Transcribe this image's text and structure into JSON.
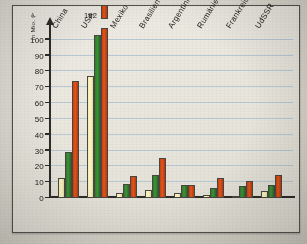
{
  "figure": {
    "corner_mark": "A."
  },
  "chart_data": {
    "type": "bar",
    "title": "",
    "subtitle": "",
    "xlabel": "",
    "ylabel": "in Mio. t",
    "ylim": [
      0,
      110
    ],
    "yticks": [
      0,
      10,
      20,
      30,
      40,
      50,
      60,
      70,
      80,
      90,
      100
    ],
    "ytick_labels": [
      "0",
      "10",
      "20",
      "30",
      "40",
      "50",
      "60",
      "70",
      "80",
      "90",
      "100"
    ],
    "grid": true,
    "legend": "none",
    "categories": [
      "China",
      "USA",
      "Mexiko",
      "Brasilien",
      "Argentinien",
      "Rumänien",
      "Frankreich",
      "UdSSR"
    ],
    "series": [
      {
        "name": "series-1",
        "color": "#f7f1bd",
        "values": [
          12.5,
          77,
          3,
          5,
          3,
          2,
          1.5,
          4.5
        ]
      },
      {
        "name": "series-2",
        "color": "#2f7a2c",
        "values": [
          29,
          103,
          9,
          14.5,
          8.5,
          6.5,
          7.5,
          8
        ]
      },
      {
        "name": "series-3",
        "color": "#d1460f",
        "values": [
          74,
          182,
          14,
          25,
          8,
          12.5,
          10.5,
          14.5
        ]
      }
    ],
    "annotations": [
      {
        "text": "182",
        "category": "USA",
        "series": "series-3",
        "note": "value exceeds axis; bar drawn broken/truncated above plot area"
      }
    ]
  },
  "colors": {
    "grid": "#aec3d4",
    "axis": "#2e2c28",
    "frame": "#55534d",
    "paper": "#e7e4db"
  }
}
